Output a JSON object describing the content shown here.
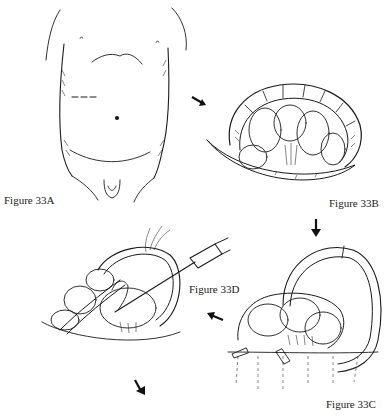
{
  "figures": [
    {
      "id": "33A",
      "label": "Figure 33A",
      "subject": "abdomen-incision-site"
    },
    {
      "id": "33B",
      "label": "Figure 33B",
      "subject": "exposed-bowel"
    },
    {
      "id": "33C",
      "label": "Figure 33C",
      "subject": "bowel-loop-retraction"
    },
    {
      "id": "33D",
      "label": "Figure 33D",
      "subject": "catheter-insertion"
    }
  ],
  "arrows": [
    {
      "from": "33A",
      "to": "33B",
      "direction": "down-right"
    },
    {
      "from": "33B",
      "to": "33C",
      "direction": "down"
    },
    {
      "from": "33C",
      "to": "33D",
      "direction": "left"
    },
    {
      "from": "33D",
      "to": "next",
      "direction": "down-right"
    }
  ],
  "colors": {
    "ink": "#1a1a1a",
    "background": "#ffffff"
  }
}
